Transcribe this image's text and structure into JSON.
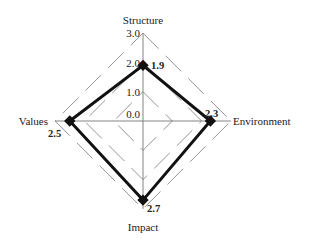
{
  "chart_data": {
    "type": "radar",
    "title": "",
    "axes": [
      "Structure",
      "Environment",
      "Impact",
      "Values"
    ],
    "values": [
      1.9,
      2.3,
      2.7,
      2.5
    ],
    "value_labels": [
      "1.9",
      "2.3",
      "2.7",
      "2.5"
    ],
    "range": [
      0,
      3.0
    ],
    "ticks": [
      0.0,
      1.0,
      2.0,
      3.0
    ],
    "tick_labels": [
      "0.0",
      "1.0",
      "2.0",
      "3.0"
    ],
    "grid": "dashed diamonds",
    "series_color": "#111111",
    "grid_color": "#888888"
  },
  "labels": {
    "structure": "Structure",
    "environment": "Environment",
    "impact": "Impact",
    "values": "Values",
    "tick0": "0.0",
    "tick1": "1.0",
    "tick2": "2.0",
    "tick3": "3.0",
    "v_structure": "1.9",
    "v_environment": "2.3",
    "v_impact": "2.7",
    "v_values": "2.5"
  }
}
